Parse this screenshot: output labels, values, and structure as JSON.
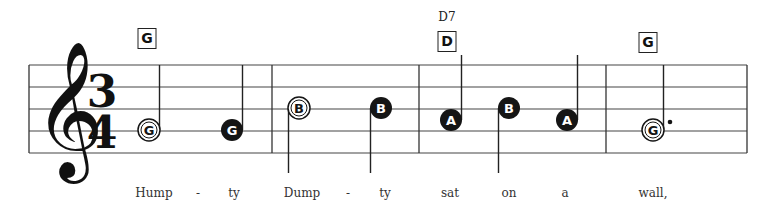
{
  "score": {
    "clef": "treble-clef",
    "time_signature": {
      "top": "3",
      "bottom": "4"
    },
    "colors": {
      "ink": "#1a1a1a",
      "staff": "#444444",
      "background": "#ffffff"
    },
    "chords": [
      {
        "box": "G",
        "name": "",
        "x": 147
      },
      {
        "box": "D",
        "name": "D7",
        "x": 447
      },
      {
        "box": "G",
        "name": "",
        "x": 648
      }
    ],
    "notes": [
      {
        "letter": "G",
        "type": "half",
        "filled": false,
        "x": 149,
        "y": 130,
        "stem": "up"
      },
      {
        "letter": "G",
        "type": "quarter",
        "filled": true,
        "x": 232,
        "y": 130,
        "stem": "up"
      },
      {
        "letter": "B",
        "type": "half",
        "filled": false,
        "x": 299,
        "y": 108,
        "stem": "down"
      },
      {
        "letter": "B",
        "type": "quarter",
        "filled": true,
        "x": 381,
        "y": 108,
        "stem": "down"
      },
      {
        "letter": "A",
        "type": "quarter",
        "filled": true,
        "x": 451,
        "y": 120,
        "stem": "up"
      },
      {
        "letter": "B",
        "type": "quarter",
        "filled": true,
        "x": 509,
        "y": 108,
        "stem": "down"
      },
      {
        "letter": "A",
        "type": "quarter",
        "filled": true,
        "x": 567,
        "y": 120,
        "stem": "up"
      },
      {
        "letter": "G",
        "type": "dotted-half",
        "filled": false,
        "x": 653,
        "y": 130,
        "stem": "up"
      }
    ],
    "lyrics": [
      {
        "text": "Hump",
        "x": 154
      },
      {
        "text": "-",
        "x": 198
      },
      {
        "text": "ty",
        "x": 234
      },
      {
        "text": "Dump",
        "x": 302
      },
      {
        "text": "-",
        "x": 348
      },
      {
        "text": "ty",
        "x": 385
      },
      {
        "text": "sat",
        "x": 450
      },
      {
        "text": "on",
        "x": 509
      },
      {
        "text": "a",
        "x": 565
      },
      {
        "text": "wall,",
        "x": 653
      }
    ]
  }
}
